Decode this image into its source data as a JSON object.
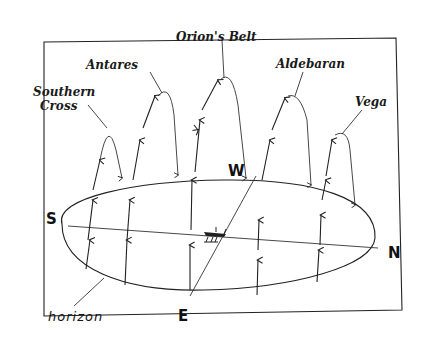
{
  "diagram": {
    "type": "celestial-sphere-star-paths",
    "stars": [
      {
        "id": "southern-cross",
        "label_line1": "Southern",
        "label_line2": "Cross"
      },
      {
        "id": "antares",
        "label_line1": "Antares"
      },
      {
        "id": "orions-belt",
        "label_line1": "Orion's Belt"
      },
      {
        "id": "aldebaran",
        "label_line1": "Aldebaran"
      },
      {
        "id": "vega",
        "label_line1": "Vega"
      }
    ],
    "directions": {
      "south": "S",
      "north": "N",
      "east": "E",
      "west": "W"
    },
    "horizon_label": "horizon",
    "observer": "ship-icon",
    "colors": {
      "ink": "#1a1a1a",
      "background": "#ffffff"
    }
  }
}
